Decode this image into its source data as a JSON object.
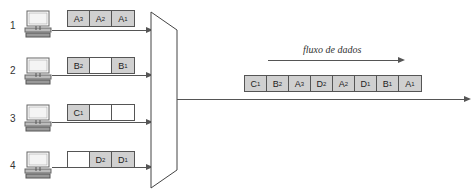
{
  "diagram": {
    "type": "tdm-multiplexer",
    "flow_label": "fluxo de dados",
    "inputs": [
      {
        "id": "1",
        "slots": [
          {
            "label": "A",
            "sub": "3",
            "filled": true
          },
          {
            "label": "A",
            "sub": "2",
            "filled": true
          },
          {
            "label": "A",
            "sub": "1",
            "filled": true
          }
        ]
      },
      {
        "id": "2",
        "slots": [
          {
            "label": "B",
            "sub": "2",
            "filled": true
          },
          {
            "label": "",
            "sub": "",
            "filled": false
          },
          {
            "label": "B",
            "sub": "1",
            "filled": true
          }
        ]
      },
      {
        "id": "3",
        "slots": [
          {
            "label": "C",
            "sub": "1",
            "filled": true
          },
          {
            "label": "",
            "sub": "",
            "filled": false
          },
          {
            "label": "",
            "sub": "",
            "filled": false
          }
        ]
      },
      {
        "id": "4",
        "slots": [
          {
            "label": "",
            "sub": "",
            "filled": false
          },
          {
            "label": "D",
            "sub": "2",
            "filled": true
          },
          {
            "label": "D",
            "sub": "1",
            "filled": true
          }
        ]
      }
    ],
    "output_stream": [
      {
        "label": "C",
        "sub": "1"
      },
      {
        "label": "B",
        "sub": "2"
      },
      {
        "label": "A",
        "sub": "3"
      },
      {
        "label": "D",
        "sub": "2"
      },
      {
        "label": "A",
        "sub": "2"
      },
      {
        "label": "D",
        "sub": "1"
      },
      {
        "label": "B",
        "sub": "1"
      },
      {
        "label": "A",
        "sub": "1"
      }
    ],
    "colors": {
      "slot_fill": "#d0d0d0",
      "line": "#555555"
    }
  }
}
